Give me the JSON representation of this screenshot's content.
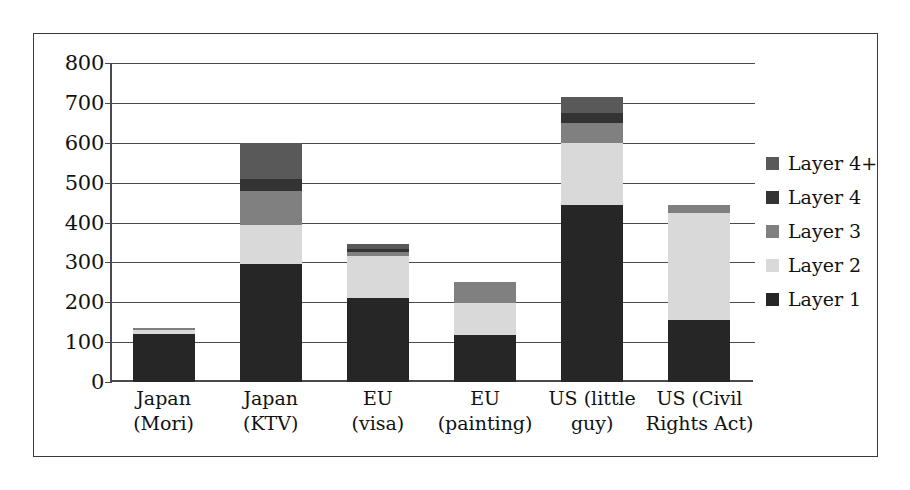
{
  "chart_data": {
    "type": "bar",
    "stacked": true,
    "title": "",
    "xlabel": "",
    "ylabel": "",
    "ylim": [
      0,
      800
    ],
    "ytick_step": 100,
    "yticks": [
      "800",
      "700",
      "600",
      "500",
      "400",
      "300",
      "200",
      "100",
      "0"
    ],
    "grid": true,
    "legend_position": "right",
    "categories": [
      "Japan\n(Mori)",
      "Japan\n(KTV)",
      "EU\n(visa)",
      "EU\n(painting)",
      "US (little\nguy)",
      "US (Civil\nRights Act)"
    ],
    "category_lines": [
      [
        "Japan",
        "(Mori)"
      ],
      [
        "Japan",
        "(KTV)"
      ],
      [
        "EU",
        "(visa)"
      ],
      [
        "EU",
        "(painting)"
      ],
      [
        "US (little",
        "guy)"
      ],
      [
        "US (Civil",
        "Rights Act)"
      ]
    ],
    "series": [
      {
        "name": "Layer 1",
        "color": "#262626",
        "values": [
          120,
          295,
          210,
          118,
          445,
          155
        ]
      },
      {
        "name": "Layer 2",
        "color": "#d9d9d9",
        "values": [
          10,
          100,
          105,
          80,
          155,
          270
        ]
      },
      {
        "name": "Layer 3",
        "color": "#808080",
        "values": [
          5,
          85,
          10,
          52,
          50,
          20
        ]
      },
      {
        "name": "Layer 4",
        "color": "#333333",
        "values": [
          0,
          30,
          8,
          0,
          25,
          0
        ]
      },
      {
        "name": "Layer 4+",
        "color": "#595959",
        "values": [
          0,
          90,
          12,
          0,
          40,
          0
        ]
      }
    ],
    "totals": [
      135,
      600,
      345,
      250,
      715,
      445
    ]
  },
  "legend": {
    "items": [
      {
        "label": "Layer 4+",
        "color": "#595959"
      },
      {
        "label": "Layer 4",
        "color": "#333333"
      },
      {
        "label": "Layer 3",
        "color": "#808080"
      },
      {
        "label": "Layer 2",
        "color": "#d9d9d9"
      },
      {
        "label": "Layer 1",
        "color": "#262626"
      }
    ]
  },
  "colors": {
    "frame": "#3a3a3a",
    "axis": "#4a4a4a",
    "background": "#ffffff",
    "text": "#111111"
  }
}
